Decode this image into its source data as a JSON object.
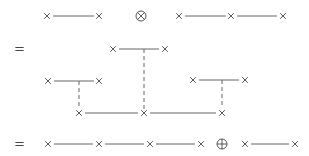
{
  "diagram": {
    "title": "",
    "rows": [
      {
        "id": "row1",
        "prefix": "",
        "terms": [
          {
            "type": "chain",
            "nodes": 2
          },
          {
            "type": "operator",
            "symbol": "⊗",
            "name": "tensor-product"
          },
          {
            "type": "chain",
            "nodes": 3
          }
        ]
      },
      {
        "id": "row2",
        "prefix": "=",
        "terms": [
          {
            "type": "tree",
            "description": "three two-node propagators joined by dashed lines to a three-node chain"
          }
        ]
      },
      {
        "id": "row3",
        "prefix": "=",
        "terms": [
          {
            "type": "chain",
            "nodes": 4
          },
          {
            "type": "operator",
            "symbol": "⊕",
            "name": "direct-sum"
          },
          {
            "type": "chain",
            "nodes": 2
          }
        ]
      }
    ],
    "symbols": {
      "node": "×",
      "equals": "=",
      "tensor": "⊗",
      "plus": "⊕"
    },
    "colors": {
      "stroke": "#555555",
      "background": "#ffffff"
    }
  }
}
